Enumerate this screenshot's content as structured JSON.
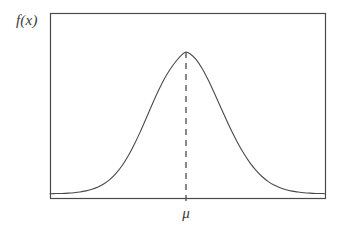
{
  "figure": {
    "background_color": "#ffffff",
    "line_color": "#4a4a4a",
    "width": 341,
    "height": 231
  },
  "labels": {
    "y_axis": "f(x)",
    "mean_tick": "μ"
  },
  "chart_data": {
    "type": "line",
    "title": "",
    "subtitle": "",
    "xlabel": "",
    "ylabel": "f(x)",
    "grid": false,
    "legend": null,
    "annotations": [
      {
        "text": "μ",
        "type": "x-axis-tick-label",
        "at_x_fraction": 0.495,
        "meaning": "mean of the distribution, located at the peak of the density curve"
      },
      {
        "text": "f(x)",
        "type": "axis-label",
        "meaning": "probability density function value"
      }
    ],
    "reference_lines": [
      {
        "orientation": "vertical",
        "style": "dashed",
        "at_x_fraction": 0.495,
        "from_y_fraction": 0.0,
        "to_y_fraction": 1.0,
        "label": "μ"
      }
    ],
    "axis_frame": {
      "left": 50,
      "right": 325,
      "top": 13,
      "bottom": 198,
      "box": true
    },
    "xlim": [
      50,
      325
    ],
    "ylim": [
      0,
      1
    ],
    "x": [
      50,
      56,
      62,
      68,
      74,
      80,
      86,
      92,
      98,
      104,
      110,
      116,
      122,
      128,
      134,
      140,
      146,
      152,
      158,
      164,
      170,
      176,
      182,
      186,
      190,
      196,
      202,
      208,
      214,
      220,
      226,
      232,
      238,
      244,
      250,
      256,
      262,
      268,
      274,
      280,
      286,
      292,
      298,
      304,
      310,
      316,
      322,
      325
    ],
    "y": [
      0.002,
      0.003,
      0.004,
      0.006,
      0.009,
      0.014,
      0.022,
      0.033,
      0.049,
      0.072,
      0.103,
      0.145,
      0.199,
      0.266,
      0.345,
      0.434,
      0.53,
      0.628,
      0.722,
      0.807,
      0.877,
      0.935,
      0.982,
      1.0,
      0.988,
      0.948,
      0.885,
      0.806,
      0.716,
      0.622,
      0.528,
      0.438,
      0.356,
      0.283,
      0.219,
      0.166,
      0.123,
      0.089,
      0.063,
      0.044,
      0.03,
      0.02,
      0.014,
      0.009,
      0.006,
      0.004,
      0.003,
      0.002
    ],
    "peak": {
      "x": 186,
      "y": 1.0
    },
    "curve_baseline_y_px": 194,
    "curve_peak_y_px": 52
  }
}
